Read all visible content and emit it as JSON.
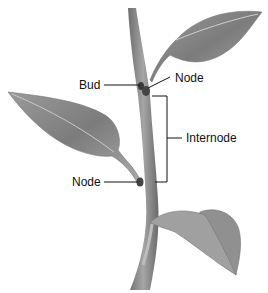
{
  "diagram": {
    "labels": {
      "bud": "Bud",
      "node_top": "Node",
      "internode": "Internode",
      "node_bottom": "Node"
    },
    "colors": {
      "stem": "#8a8a8a",
      "leaf": "#8c8c8c",
      "leaf_light": "#b8b8b8",
      "line": "#111111"
    }
  }
}
